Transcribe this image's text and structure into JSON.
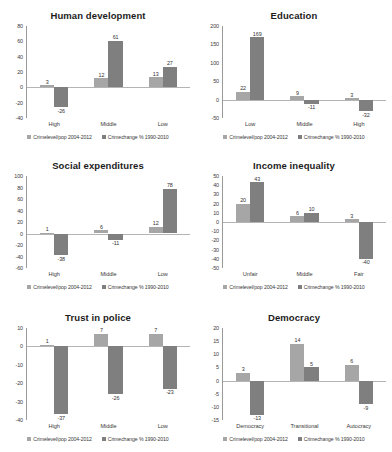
{
  "legend": {
    "series": [
      {
        "name": "Crimelevel/pop 2004-2012",
        "color": "#a6a6a6"
      },
      {
        "name": "Crimechange % 1990-2010",
        "color": "#7f7f7f"
      }
    ]
  },
  "chart_data": [
    {
      "type": "bar",
      "title": "Human development",
      "categories": [
        "High",
        "Middle",
        "Low"
      ],
      "series": [
        {
          "name": "Crimelevel/pop 2004-2012",
          "values": [
            3,
            12,
            13
          ]
        },
        {
          "name": "Crimechange % 1990-2010",
          "values": [
            -26,
            61,
            27
          ]
        }
      ],
      "yticks": [
        80,
        60,
        40,
        20,
        0,
        -20,
        -40
      ],
      "ylim": [
        -40,
        80
      ],
      "xlabel": "",
      "ylabel": "",
      "grid": false,
      "legend_position": "bottom"
    },
    {
      "type": "bar",
      "title": "Education",
      "categories": [
        "Low",
        "Middle",
        "High"
      ],
      "series": [
        {
          "name": "Crimelevel/pop 2004-2012",
          "values": [
            22,
            9,
            3
          ]
        },
        {
          "name": "Crimechange % 1990-2010",
          "values": [
            169,
            -11,
            -32
          ]
        }
      ],
      "yticks": [
        200,
        150,
        100,
        50,
        0,
        -50
      ],
      "ylim": [
        -50,
        200
      ],
      "xlabel": "",
      "ylabel": "",
      "grid": false,
      "legend_position": "bottom"
    },
    {
      "type": "bar",
      "title": "Social expenditures",
      "categories": [
        "High",
        "Middle",
        "Low"
      ],
      "series": [
        {
          "name": "Crimelevel/pop 2004-2012",
          "values": [
            1,
            6,
            12
          ]
        },
        {
          "name": "Crimechange % 1990-2010",
          "values": [
            -38,
            -11,
            78
          ]
        }
      ],
      "yticks": [
        100,
        80,
        60,
        40,
        20,
        0,
        -20,
        -40,
        -60
      ],
      "ylim": [
        -60,
        100
      ],
      "xlabel": "",
      "ylabel": "",
      "grid": false,
      "legend_position": "bottom"
    },
    {
      "type": "bar",
      "title": "Income inequality",
      "categories": [
        "Unfair",
        "Middle",
        "Fair"
      ],
      "series": [
        {
          "name": "Crimelevel/pop 2004-2012",
          "values": [
            20,
            6,
            3
          ]
        },
        {
          "name": "Crimechange % 1990-2010",
          "values": [
            43,
            10,
            -40
          ]
        }
      ],
      "yticks": [
        50,
        40,
        30,
        20,
        10,
        0,
        -10,
        -20,
        -30,
        -40,
        -50
      ],
      "ylim": [
        -50,
        50
      ],
      "xlabel": "",
      "ylabel": "",
      "grid": false,
      "legend_position": "bottom"
    },
    {
      "type": "bar",
      "title": "Trust in police",
      "categories": [
        "High",
        "Middle",
        "Low"
      ],
      "series": [
        {
          "name": "Crimelevel/pop 2004-2012",
          "values": [
            1,
            7,
            7
          ]
        },
        {
          "name": "Crimechange % 1990-2010",
          "values": [
            -37,
            -26,
            -23
          ]
        }
      ],
      "yticks": [
        10,
        0,
        -10,
        -20,
        -30,
        -40
      ],
      "ylim": [
        -40,
        10
      ],
      "xlabel": "",
      "ylabel": "",
      "grid": false,
      "legend_position": "bottom"
    },
    {
      "type": "bar",
      "title": "Democracy",
      "categories": [
        "Democracy",
        "Transitional",
        "Autocracy"
      ],
      "series": [
        {
          "name": "Crimelevel/pop 2004-2012",
          "values": [
            3,
            14,
            6
          ]
        },
        {
          "name": "Crimechange % 1990-2010",
          "values": [
            -13,
            5,
            -9
          ]
        }
      ],
      "yticks": [
        20,
        15,
        10,
        5,
        0,
        -5,
        -10,
        -15
      ],
      "ylim": [
        -15,
        20
      ],
      "xlabel": "",
      "ylabel": "",
      "grid": false,
      "legend_position": "bottom"
    }
  ]
}
